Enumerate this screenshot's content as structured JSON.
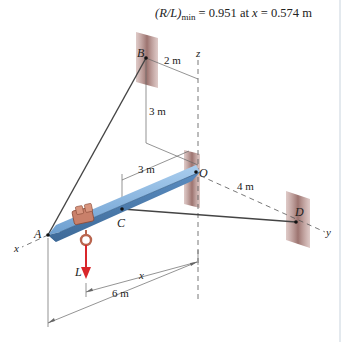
{
  "result": {
    "lhs": "(R/L)",
    "sub": "min",
    "eq1": " = 0.951 at ",
    "var": "x",
    "eq2": " = 0.574 m"
  },
  "points": {
    "A": "A",
    "B": "B",
    "C": "C",
    "D": "D",
    "O": "O"
  },
  "axes": {
    "x": "x",
    "y": "y",
    "z": "z"
  },
  "force": {
    "label": "L",
    "color": "#d9262b"
  },
  "dimensions": {
    "bz": "2 m",
    "bh": "3 m",
    "oc": "3 m",
    "od": "4 m",
    "x": "x",
    "span": "6 m"
  },
  "colors": {
    "beam": "#6a9fd4",
    "beam_dark": "#3e6f9e",
    "wall": "#a57c78",
    "trolley": "#c9806a",
    "cable": "#333333"
  }
}
